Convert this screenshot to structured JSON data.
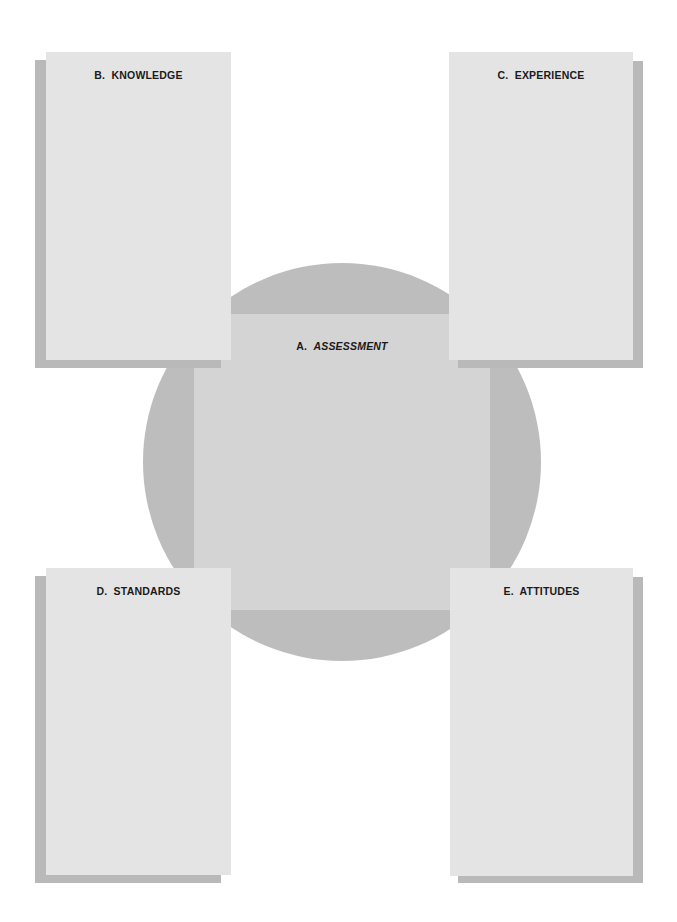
{
  "diagram": {
    "center": {
      "letter": "A.",
      "label": "ASSESSMENT"
    },
    "cards": [
      {
        "id": "knowledge",
        "title": "B.  KNOWLEDGE"
      },
      {
        "id": "experience",
        "title": "C.  EXPERIENCE"
      },
      {
        "id": "standards",
        "title": "D.  STANDARDS"
      },
      {
        "id": "attitudes",
        "title": "E.  ATTITUDES"
      }
    ]
  },
  "colors": {
    "background": "#ffffff",
    "circle": "#bdbdbd",
    "center_square": "#d4d4d4",
    "card_fill": "#e4e4e4",
    "card_shadow": "#b9b9b9",
    "text": "#1a1a1a"
  }
}
